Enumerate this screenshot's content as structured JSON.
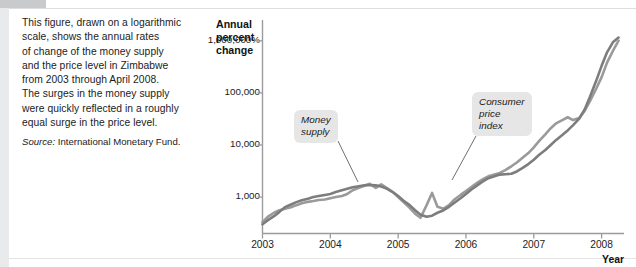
{
  "caption": {
    "lines": [
      "This figure, drawn on a logarithmic",
      "scale, shows the annual rates",
      "of change of the money supply",
      "and the price level in Zimbabwe",
      "from 2003 through April 2008.",
      "The surges in the money supply",
      "were quickly reflected in a roughly",
      "equal surge in the price level."
    ],
    "source_label": "Source:",
    "source_text": " International Monetary Fund."
  },
  "chart_data": {
    "type": "line",
    "title": "",
    "ylabel": "Annual percent change",
    "xlabel": "Year",
    "y_scale": "log",
    "ytick_labels": [
      "1,000,000%",
      "100,000",
      "10,000",
      "1,000"
    ],
    "ytick_values": [
      1000000,
      100000,
      10000,
      1000
    ],
    "ylim": [
      200,
      2500000
    ],
    "xtick_labels": [
      "2003",
      "2004",
      "2005",
      "2006",
      "2007",
      "2008"
    ],
    "xlim": [
      2003,
      2008.33
    ],
    "grid": false,
    "legend": "annotations",
    "annotations": [
      {
        "name": "money-supply",
        "label": "Money\nsupply",
        "text_line1": "Money",
        "text_line2": "supply"
      },
      {
        "name": "consumer-price-index",
        "label": "Consumer price index",
        "text_line1": "Consumer",
        "text_line2": "price",
        "text_line3": "index"
      }
    ],
    "colors": {
      "money_supply": "#9a9a9a",
      "consumer_price_index": "#7d7d7d",
      "axis": "#9b9b9b",
      "annotation_box": "#e6e6e6"
    },
    "series": [
      {
        "name": "Money supply",
        "color": "#9a9a9a",
        "x": [
          2003.0,
          2003.08,
          2003.17,
          2003.25,
          2003.33,
          2003.42,
          2003.5,
          2003.58,
          2003.67,
          2003.75,
          2003.83,
          2003.92,
          2004.0,
          2004.08,
          2004.17,
          2004.25,
          2004.33,
          2004.42,
          2004.5,
          2004.58,
          2004.67,
          2004.75,
          2004.83,
          2004.92,
          2005.0,
          2005.08,
          2005.17,
          2005.25,
          2005.33,
          2005.42,
          2005.5,
          2005.58,
          2005.67,
          2005.75,
          2005.83,
          2005.92,
          2006.0,
          2006.08,
          2006.17,
          2006.25,
          2006.33,
          2006.42,
          2006.5,
          2006.58,
          2006.67,
          2006.75,
          2006.83,
          2006.92,
          2007.0,
          2007.08,
          2007.17,
          2007.25,
          2007.33,
          2007.42,
          2007.5,
          2007.58,
          2007.67,
          2007.75,
          2007.83,
          2007.92,
          2008.0,
          2008.08,
          2008.17,
          2008.25
        ],
        "y": [
          330,
          420,
          500,
          560,
          600,
          640,
          700,
          760,
          810,
          840,
          880,
          900,
          950,
          1000,
          1050,
          1150,
          1350,
          1500,
          1650,
          1800,
          1500,
          1750,
          1500,
          1250,
          1000,
          800,
          620,
          480,
          400,
          700,
          1200,
          650,
          600,
          700,
          900,
          1100,
          1300,
          1550,
          1900,
          2200,
          2500,
          2700,
          2900,
          3300,
          3900,
          4600,
          5600,
          7000,
          9000,
          12000,
          16000,
          21000,
          26000,
          30000,
          34000,
          30000,
          33000,
          45000,
          70000,
          120000,
          200000,
          380000,
          650000,
          1000000
        ]
      },
      {
        "name": "Consumer price index",
        "color": "#7d7d7d",
        "x": [
          2003.0,
          2003.08,
          2003.17,
          2003.25,
          2003.33,
          2003.42,
          2003.5,
          2003.58,
          2003.67,
          2003.75,
          2003.83,
          2003.92,
          2004.0,
          2004.08,
          2004.17,
          2004.25,
          2004.33,
          2004.42,
          2004.5,
          2004.58,
          2004.67,
          2004.75,
          2004.83,
          2004.92,
          2005.0,
          2005.08,
          2005.17,
          2005.25,
          2005.33,
          2005.42,
          2005.5,
          2005.58,
          2005.67,
          2005.75,
          2005.83,
          2005.92,
          2006.0,
          2006.08,
          2006.17,
          2006.25,
          2006.33,
          2006.42,
          2006.5,
          2006.58,
          2006.67,
          2006.75,
          2006.83,
          2006.92,
          2007.0,
          2007.08,
          2007.17,
          2007.25,
          2007.33,
          2007.42,
          2007.5,
          2007.58,
          2007.67,
          2007.75,
          2007.83,
          2007.92,
          2008.0,
          2008.08,
          2008.17,
          2008.25
        ],
        "y": [
          300,
          360,
          430,
          520,
          640,
          720,
          800,
          870,
          930,
          1000,
          1050,
          1100,
          1150,
          1250,
          1350,
          1450,
          1550,
          1620,
          1680,
          1700,
          1680,
          1600,
          1450,
          1250,
          1050,
          850,
          700,
          560,
          460,
          420,
          440,
          500,
          560,
          650,
          780,
          950,
          1150,
          1400,
          1700,
          2000,
          2300,
          2500,
          2700,
          2750,
          2800,
          3100,
          3600,
          4300,
          5200,
          6500,
          8000,
          10000,
          12500,
          15500,
          19000,
          24000,
          32000,
          48000,
          85000,
          170000,
          330000,
          600000,
          950000,
          1150000
        ]
      }
    ]
  }
}
